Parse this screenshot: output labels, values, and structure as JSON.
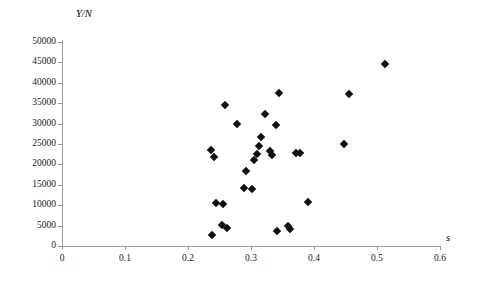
{
  "chart_data": {
    "type": "scatter",
    "title": "",
    "subtitle": "",
    "xlabel": "s",
    "ylabel": "Y/N",
    "xlim": [
      0,
      0.6
    ],
    "ylim": [
      0,
      50000
    ],
    "xticks": [
      "0",
      "0.1",
      "0.2",
      "0.3",
      "0.4",
      "0.5",
      "0.6"
    ],
    "xtick_values": [
      0,
      0.1,
      0.2,
      0.3,
      0.4,
      0.5,
      0.6
    ],
    "yticks": [
      "0",
      "5000",
      "10000",
      "15000",
      "20000",
      "25000",
      "30000",
      "35000",
      "40000",
      "45000",
      "50000"
    ],
    "ytick_values": [
      0,
      5000,
      10000,
      15000,
      20000,
      25000,
      30000,
      35000,
      40000,
      45000,
      50000
    ],
    "grid": false,
    "legend": false,
    "legend_position": "none",
    "marker": "diamond",
    "marker_color": "#111111",
    "axis_color": "#9a9a9a",
    "background": "#ffffff",
    "series": [
      {
        "name": "observations",
        "points": [
          {
            "x": 0.238,
            "y": 2700
          },
          {
            "x": 0.237,
            "y": 23600
          },
          {
            "x": 0.259,
            "y": 34600
          },
          {
            "x": 0.278,
            "y": 29900
          },
          {
            "x": 0.241,
            "y": 21800
          },
          {
            "x": 0.245,
            "y": 10500
          },
          {
            "x": 0.256,
            "y": 10400
          },
          {
            "x": 0.254,
            "y": 5100
          },
          {
            "x": 0.262,
            "y": 4400
          },
          {
            "x": 0.292,
            "y": 18500
          },
          {
            "x": 0.289,
            "y": 14100
          },
          {
            "x": 0.302,
            "y": 14000
          },
          {
            "x": 0.305,
            "y": 21100
          },
          {
            "x": 0.31,
            "y": 22600
          },
          {
            "x": 0.313,
            "y": 24400
          },
          {
            "x": 0.316,
            "y": 26800
          },
          {
            "x": 0.33,
            "y": 23200
          },
          {
            "x": 0.334,
            "y": 22300
          },
          {
            "x": 0.322,
            "y": 32300
          },
          {
            "x": 0.34,
            "y": 29600
          },
          {
            "x": 0.344,
            "y": 37400
          },
          {
            "x": 0.341,
            "y": 3600
          },
          {
            "x": 0.358,
            "y": 4900
          },
          {
            "x": 0.362,
            "y": 4200
          },
          {
            "x": 0.371,
            "y": 22800
          },
          {
            "x": 0.378,
            "y": 22800
          },
          {
            "x": 0.391,
            "y": 10900
          },
          {
            "x": 0.448,
            "y": 24900
          },
          {
            "x": 0.455,
            "y": 37200
          },
          {
            "x": 0.512,
            "y": 44700
          }
        ]
      }
    ]
  }
}
